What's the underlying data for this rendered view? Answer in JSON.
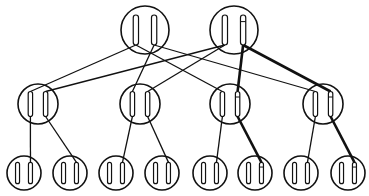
{
  "diagram": {
    "title": "",
    "type": "tree",
    "stroke_color": "#111111",
    "background": "#ffffff",
    "levels": [
      {
        "name": "root",
        "nodes": [
          {
            "id": "R1",
            "cx": 145,
            "cy": 30,
            "r": 24,
            "slots": [
              "plain",
              "plain"
            ]
          },
          {
            "id": "R2",
            "cx": 234,
            "cy": 30,
            "r": 24,
            "slots": [
              "plain",
              "marked"
            ]
          }
        ]
      },
      {
        "name": "middle",
        "nodes": [
          {
            "id": "M1",
            "cx": 38,
            "cy": 104,
            "r": 20,
            "slots": [
              "plain",
              "plain"
            ]
          },
          {
            "id": "M2",
            "cx": 140,
            "cy": 104,
            "r": 20,
            "slots": [
              "plain",
              "plain"
            ]
          },
          {
            "id": "M3",
            "cx": 230,
            "cy": 104,
            "r": 20,
            "slots": [
              "plain",
              "marked"
            ]
          },
          {
            "id": "M4",
            "cx": 323,
            "cy": 104,
            "r": 20,
            "slots": [
              "plain",
              "marked"
            ]
          }
        ]
      },
      {
        "name": "leaves",
        "nodes": [
          {
            "id": "L1",
            "cx": 24,
            "cy": 173,
            "r": 17,
            "slots": [
              "plain",
              "plain"
            ]
          },
          {
            "id": "L2",
            "cx": 70,
            "cy": 173,
            "r": 17,
            "slots": [
              "plain",
              "plain"
            ]
          },
          {
            "id": "L3",
            "cx": 116,
            "cy": 173,
            "r": 17,
            "slots": [
              "plain",
              "plain"
            ]
          },
          {
            "id": "L4",
            "cx": 162,
            "cy": 173,
            "r": 17,
            "slots": [
              "plain",
              "plain"
            ]
          },
          {
            "id": "L5",
            "cx": 210,
            "cy": 173,
            "r": 17,
            "slots": [
              "plain",
              "plain"
            ]
          },
          {
            "id": "L6",
            "cx": 255,
            "cy": 173,
            "r": 17,
            "slots": [
              "plain",
              "marked"
            ]
          },
          {
            "id": "L7",
            "cx": 301,
            "cy": 173,
            "r": 17,
            "slots": [
              "plain",
              "plain"
            ]
          },
          {
            "id": "L8",
            "cx": 348,
            "cy": 173,
            "r": 17,
            "slots": [
              "plain",
              "marked"
            ]
          }
        ]
      }
    ],
    "edges": [
      {
        "from": "R1",
        "from_slot": 0,
        "to": "M1",
        "to_slot": 0,
        "bold": false
      },
      {
        "from": "R1",
        "from_slot": 0,
        "to": "M3",
        "to_slot": 0,
        "bold": false
      },
      {
        "from": "R1",
        "from_slot": 1,
        "to": "M2",
        "to_slot": 0,
        "bold": false
      },
      {
        "from": "R1",
        "from_slot": 1,
        "to": "M4",
        "to_slot": 0,
        "bold": false
      },
      {
        "from": "R2",
        "from_slot": 0,
        "to": "M1",
        "to_slot": 1,
        "bold": false
      },
      {
        "from": "R2",
        "from_slot": 0,
        "to": "M2",
        "to_slot": 1,
        "bold": false
      },
      {
        "from": "R2",
        "from_slot": 1,
        "to": "M3",
        "to_slot": 1,
        "bold": true
      },
      {
        "from": "R2",
        "from_slot": 1,
        "to": "M4",
        "to_slot": 1,
        "bold": true
      },
      {
        "from": "M1",
        "from_slot": 0,
        "to": "L1",
        "to_slot": 1,
        "bold": false
      },
      {
        "from": "M1",
        "from_slot": 1,
        "to": "L2",
        "to_slot": 1,
        "bold": false
      },
      {
        "from": "M2",
        "from_slot": 0,
        "to": "L3",
        "to_slot": 1,
        "bold": false
      },
      {
        "from": "M2",
        "from_slot": 1,
        "to": "L4",
        "to_slot": 1,
        "bold": false
      },
      {
        "from": "M3",
        "from_slot": 0,
        "to": "L5",
        "to_slot": 1,
        "bold": false
      },
      {
        "from": "M3",
        "from_slot": 1,
        "to": "L6",
        "to_slot": 1,
        "bold": true
      },
      {
        "from": "M4",
        "from_slot": 0,
        "to": "L7",
        "to_slot": 1,
        "bold": false
      },
      {
        "from": "M4",
        "from_slot": 1,
        "to": "L8",
        "to_slot": 1,
        "bold": true
      }
    ]
  }
}
